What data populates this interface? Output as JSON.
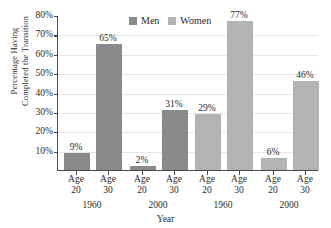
{
  "chart_data": {
    "type": "bar",
    "title": "",
    "xlabel": "Year",
    "ylabel_line1": "Percentage Having",
    "ylabel_line2": "Completed the Transition",
    "ylim": [
      0,
      80
    ],
    "yticks": [
      "10%",
      "20%",
      "30%",
      "40%",
      "50%",
      "60%",
      "70%",
      "80%"
    ],
    "ytick_values": [
      10,
      20,
      30,
      40,
      50,
      60,
      70,
      80
    ],
    "grid": true,
    "legend_position": "top-center",
    "legend": [
      "Men",
      "Women"
    ],
    "colors": {
      "men": "#8a8a8a",
      "women": "#b3b3b3",
      "axis": "#4a4a4a",
      "grid": "#e6e6e6",
      "text": "#2b2b2b",
      "background": "#ffffff"
    },
    "categories": [
      "Age 20",
      "Age 30",
      "Age 20",
      "Age 30",
      "Age 20",
      "Age 30",
      "Age 20",
      "Age 30"
    ],
    "groups": [
      {
        "year": "1960",
        "series": "Men"
      },
      {
        "year": "2000",
        "series": "Men"
      },
      {
        "year": "1960",
        "series": "Women"
      },
      {
        "year": "2000",
        "series": "Women"
      }
    ],
    "values": [
      9,
      65,
      2,
      31,
      29,
      77,
      6,
      46
    ],
    "value_labels": [
      "9%",
      "65%",
      "2%",
      "31%",
      "29%",
      "77%",
      "6%",
      "46%"
    ],
    "bars": [
      {
        "age": "Age",
        "age_num": "20",
        "year": "1960",
        "series": "Men",
        "value": 9,
        "label": "9%"
      },
      {
        "age": "Age",
        "age_num": "30",
        "year": "1960",
        "series": "Men",
        "value": 65,
        "label": "65%"
      },
      {
        "age": "Age",
        "age_num": "20",
        "year": "2000",
        "series": "Men",
        "value": 2,
        "label": "2%"
      },
      {
        "age": "Age",
        "age_num": "30",
        "year": "2000",
        "series": "Men",
        "value": 31,
        "label": "31%"
      },
      {
        "age": "Age",
        "age_num": "20",
        "year": "1960",
        "series": "Women",
        "value": 29,
        "label": "29%"
      },
      {
        "age": "Age",
        "age_num": "30",
        "year": "1960",
        "series": "Women",
        "value": 77,
        "label": "77%"
      },
      {
        "age": "Age",
        "age_num": "20",
        "year": "2000",
        "series": "Women",
        "value": 6,
        "label": "6%"
      },
      {
        "age": "Age",
        "age_num": "30",
        "year": "2000",
        "series": "Women",
        "value": 46,
        "label": "46%"
      }
    ],
    "year_labels": [
      "1960",
      "2000",
      "1960",
      "2000"
    ]
  }
}
